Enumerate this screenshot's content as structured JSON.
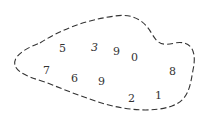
{
  "diagram": {
    "stroke_color": "#333333",
    "digits": [
      {
        "id": "d5",
        "text": "5"
      },
      {
        "id": "d3",
        "text": "3",
        "italic": true
      },
      {
        "id": "d9a",
        "text": "9"
      },
      {
        "id": "d0",
        "text": "0"
      },
      {
        "id": "d7",
        "text": "7"
      },
      {
        "id": "d6",
        "text": "6"
      },
      {
        "id": "d9b",
        "text": "9"
      },
      {
        "id": "d8",
        "text": "8"
      },
      {
        "id": "d2",
        "text": "2"
      },
      {
        "id": "d1",
        "text": "1"
      }
    ]
  }
}
